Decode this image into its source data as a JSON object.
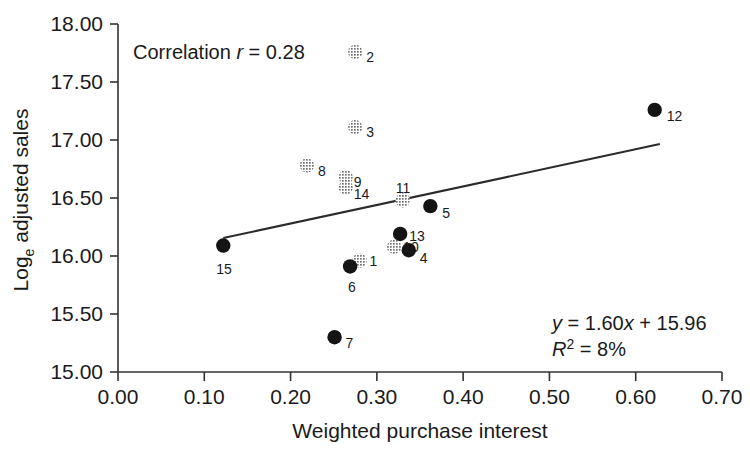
{
  "chart_data": {
    "type": "scatter",
    "title": "",
    "xlabel": "Weighted purchase interest",
    "ylabel": "Loge adjusted sales",
    "ylabel_main": "Log",
    "ylabel_sub": "e",
    "ylabel_rest": " adjusted sales",
    "xlim": [
      0.0,
      0.7
    ],
    "ylim": [
      15.0,
      18.0
    ],
    "xticks": [
      "0.00",
      "0.10",
      "0.20",
      "0.30",
      "0.40",
      "0.50",
      "0.60",
      "0.70"
    ],
    "xtick_values": [
      0.0,
      0.1,
      0.2,
      0.3,
      0.4,
      0.5,
      0.6,
      0.7
    ],
    "yticks": [
      "15.00",
      "15.50",
      "16.00",
      "16.50",
      "17.00",
      "17.50",
      "18.00"
    ],
    "ytick_values": [
      15.0,
      15.5,
      16.0,
      16.5,
      17.0,
      17.5,
      18.0
    ],
    "grid": false,
    "legend": "none",
    "points": [
      {
        "label": "1",
        "x": 0.28,
        "y": 15.96,
        "style": "gray",
        "label_dx": 10,
        "label_dy": 0
      },
      {
        "label": "2",
        "x": 0.275,
        "y": 17.76,
        "style": "gray",
        "label_dx": 11,
        "label_dy": 5
      },
      {
        "label": "3",
        "x": 0.275,
        "y": 17.11,
        "style": "gray",
        "label_dx": 11,
        "label_dy": 5
      },
      {
        "label": "4",
        "x": 0.337,
        "y": 16.05,
        "style": "dark",
        "label_dx": 11,
        "label_dy": 8
      },
      {
        "label": "5",
        "x": 0.362,
        "y": 16.43,
        "style": "dark",
        "label_dx": 12,
        "label_dy": 7
      },
      {
        "label": "6",
        "x": 0.269,
        "y": 15.91,
        "style": "dark",
        "label_dx": -2,
        "label_dy": 21
      },
      {
        "label": "7",
        "x": 0.251,
        "y": 15.3,
        "style": "dark",
        "label_dx": 11,
        "label_dy": 6
      },
      {
        "label": "8",
        "x": 0.219,
        "y": 16.78,
        "style": "gray",
        "label_dx": 11,
        "label_dy": 5
      },
      {
        "label": "9",
        "x": 0.264,
        "y": 16.68,
        "style": "gray",
        "label_dx": 8,
        "label_dy": 5
      },
      {
        "label": "10",
        "x": 0.32,
        "y": 16.08,
        "style": "gray",
        "label_dx": 9,
        "label_dy": 0
      },
      {
        "label": "11",
        "x": 0.33,
        "y": 16.48,
        "style": "gray",
        "label_dx": -7,
        "label_dy": -12
      },
      {
        "label": "12",
        "x": 0.622,
        "y": 17.26,
        "style": "dark",
        "label_dx": 12,
        "label_dy": 6
      },
      {
        "label": "13",
        "x": 0.327,
        "y": 16.19,
        "style": "dark",
        "label_dx": 9,
        "label_dy": 2
      },
      {
        "label": "14",
        "x": 0.264,
        "y": 16.59,
        "style": "gray",
        "label_dx": 8,
        "label_dy": 6
      },
      {
        "label": "15",
        "x": 0.122,
        "y": 16.09,
        "style": "dark",
        "label_dx": -7,
        "label_dy": 23
      }
    ],
    "fit_line": {
      "slope": 1.6,
      "intercept": 15.96,
      "x_start": 0.122,
      "x_end": 0.628
    },
    "annotations": {
      "correlation_prefix": "Correlation ",
      "correlation_symbol": "r",
      "correlation_eq": " = 0.28",
      "equation_y": "y",
      "equation_rest": " = 1.60",
      "equation_x": "x",
      "equation_tail": " + 15.96",
      "r2_symbol": "R",
      "r2_sup": "2",
      "r2_value": " = 8%"
    },
    "colors": {
      "dark_marker": "#141414",
      "gray_marker": "#8f8f8f",
      "axis": "#333333",
      "fit_line": "#2b2b2b",
      "text": "#1a1a1a"
    }
  }
}
